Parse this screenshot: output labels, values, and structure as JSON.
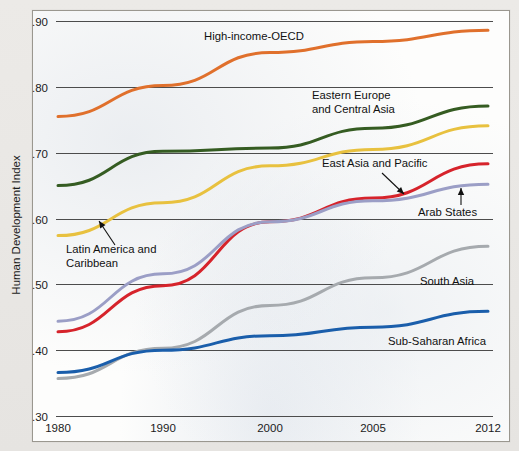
{
  "chart_data": {
    "type": "line",
    "title": "",
    "xlabel": "",
    "ylabel": "Human Development Index",
    "x": [
      1980,
      1990,
      2000,
      2005,
      2012
    ],
    "xticklabels": [
      "1980",
      "1990",
      "2000",
      "2005",
      "2012"
    ],
    "yticklabels": [
      ".90",
      ".80",
      ".70",
      ".60",
      ".50",
      ".40",
      ".30"
    ],
    "ytickvalues": [
      0.9,
      0.8,
      0.7,
      0.6,
      0.5,
      0.4,
      0.3
    ],
    "ylim": [
      0.3,
      0.9
    ],
    "xlim": [
      1980,
      2012
    ],
    "grid": "horizontal",
    "legend": "inline-labels",
    "series": [
      {
        "name": "High-income-OECD",
        "color": "#e0702c",
        "values": [
          0.755,
          0.802,
          0.852,
          0.869,
          0.886
        ],
        "label": "High-income-OECD",
        "label_x": 204,
        "label_y": 40,
        "annotation": false
      },
      {
        "name": "Eastern Europe and Central Asia",
        "color": "#355c22",
        "values": [
          0.65,
          0.702,
          0.707,
          0.737,
          0.771
        ],
        "label": "Eastern Europe\nand Central Asia",
        "label_x": 312,
        "label_y": 99,
        "annotation": false
      },
      {
        "name": "Latin America and Caribbean",
        "color": "#e8c13f",
        "values": [
          0.574,
          0.624,
          0.68,
          0.705,
          0.741
        ],
        "label": "Latin America and\nCaribbean",
        "label_x": 66,
        "label_y": 253,
        "annotation": true,
        "arrow_from_x": 115,
        "arrow_from_y": 245,
        "arrow_to_x": 99,
        "arrow_to_y": 221
      },
      {
        "name": "East Asia and Pacific",
        "color": "#d6232b",
        "values": [
          0.428,
          0.498,
          0.595,
          0.631,
          0.683
        ],
        "label": "East Asia and Pacific",
        "label_x": 322,
        "label_y": 167,
        "annotation": true,
        "arrow_from_x": 382,
        "arrow_from_y": 173,
        "arrow_to_x": 404,
        "arrow_to_y": 194
      },
      {
        "name": "Arab States",
        "color": "#9b9ec6",
        "values": [
          0.444,
          0.516,
          0.595,
          0.627,
          0.652
        ],
        "label": "Arab States",
        "label_x": 418,
        "label_y": 216,
        "annotation": true,
        "arrow_from_x": 461,
        "arrow_from_y": 205,
        "arrow_to_x": 461,
        "arrow_to_y": 188
      },
      {
        "name": "South Asia",
        "color": "#a6aaae",
        "values": [
          0.357,
          0.403,
          0.468,
          0.51,
          0.558
        ],
        "label": "South Asia",
        "label_x": 420,
        "label_y": 285,
        "annotation": false
      },
      {
        "name": "Sub-Saharan Africa",
        "color": "#1a5eab",
        "values": [
          0.366,
          0.4,
          0.422,
          0.435,
          0.459
        ],
        "label": "Sub-Saharan Africa",
        "label_x": 388,
        "label_y": 345,
        "annotation": false
      }
    ]
  },
  "axis": {
    "y_title": "Human Development Index"
  }
}
